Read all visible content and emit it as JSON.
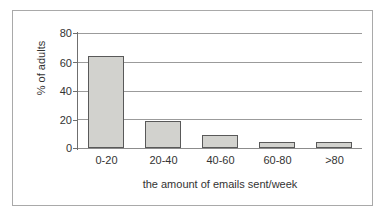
{
  "figure": {
    "background_color": "#ffffff",
    "frame_color": "#a9a9a9",
    "top_artifact_text": ""
  },
  "chart_data": {
    "type": "bar",
    "title": "",
    "subtitle": "",
    "xlabel": "the amount of emails sent/week",
    "ylabel": "% of adults",
    "categories": [
      "0-20",
      "20-40",
      "40-60",
      "60-80",
      ">80"
    ],
    "values": [
      64,
      19,
      9,
      4,
      4
    ],
    "series": [
      {
        "name": "% of adults",
        "values": [
          64,
          19,
          9,
          4,
          4
        ]
      }
    ],
    "ylim": [
      0,
      80
    ],
    "yticks": [
      0,
      20,
      40,
      60,
      80
    ],
    "ytick_labels": [
      "0",
      "20",
      "40",
      "60",
      "80"
    ],
    "xlim_categories": 5,
    "grid": "horizontal",
    "legend": "none",
    "bar_fill_color": "#d2d2ce",
    "bar_edge_color": "#595959",
    "gridline_color": "#9b9b9b",
    "axis_color": "#6f6f6f",
    "text_color": "#333333",
    "annotations": []
  }
}
